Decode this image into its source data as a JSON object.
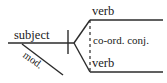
{
  "diagram": {
    "type": "sentence-diagram",
    "background_color": "#ffffff",
    "line_color": "#2b2b2b",
    "text_color": "#1a1a1a",
    "labels": {
      "subject": "subject",
      "verb_top": "verb",
      "verb_bottom": "verb",
      "coordinating_conjunction": "co-ord. conj.",
      "modifier": "mod."
    },
    "lines": {
      "baseline": {
        "x1": 8,
        "y1": 43,
        "x2": 74,
        "y2": 43,
        "style": "solid"
      },
      "subject_verb_divider": {
        "x1": 68,
        "y1": 30,
        "x2": 68,
        "y2": 54,
        "style": "solid"
      },
      "modifier_slant": {
        "x1": 22,
        "y1": 44,
        "x2": 63,
        "y2": 75,
        "style": "solid"
      },
      "fork_upper": {
        "x1": 74,
        "y1": 43,
        "x2": 90,
        "y2": 20,
        "style": "solid"
      },
      "fork_lower": {
        "x1": 74,
        "y1": 43,
        "x2": 90,
        "y2": 72,
        "style": "solid"
      },
      "verb_top_baseline": {
        "x1": 90,
        "y1": 20,
        "x2": 163,
        "y2": 20,
        "style": "solid"
      },
      "verb_bottom_baseline": {
        "x1": 90,
        "y1": 72,
        "x2": 163,
        "y2": 72,
        "style": "solid"
      },
      "conjunction_connector": {
        "x1": 90,
        "y1": 20,
        "x2": 90,
        "y2": 72,
        "style": "dashed"
      }
    }
  }
}
